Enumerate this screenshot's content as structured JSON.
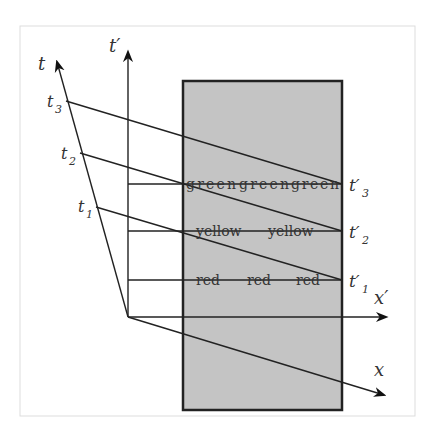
{
  "diagram": {
    "type": "spacetime-diagram",
    "axes": {
      "t": "t",
      "t_prime": "t′",
      "x": "x",
      "x_prime": "x′"
    },
    "t_ticks": [
      {
        "label": "t",
        "sub": "3"
      },
      {
        "label": "t",
        "sub": "2"
      },
      {
        "label": "t",
        "sub": "1"
      }
    ],
    "t_prime_ticks": [
      {
        "label": "t′",
        "sub": "3"
      },
      {
        "label": "t′",
        "sub": "2"
      },
      {
        "label": "t′",
        "sub": "1"
      }
    ],
    "rows": [
      {
        "words": [
          "green",
          "green",
          "green"
        ]
      },
      {
        "words": [
          "yellow",
          "yellow"
        ]
      },
      {
        "words": [
          "red",
          "red",
          "red"
        ]
      }
    ],
    "colors": {
      "region_fill": "#c4c4c4",
      "line": "#222222",
      "frame": "#dddddd"
    }
  }
}
